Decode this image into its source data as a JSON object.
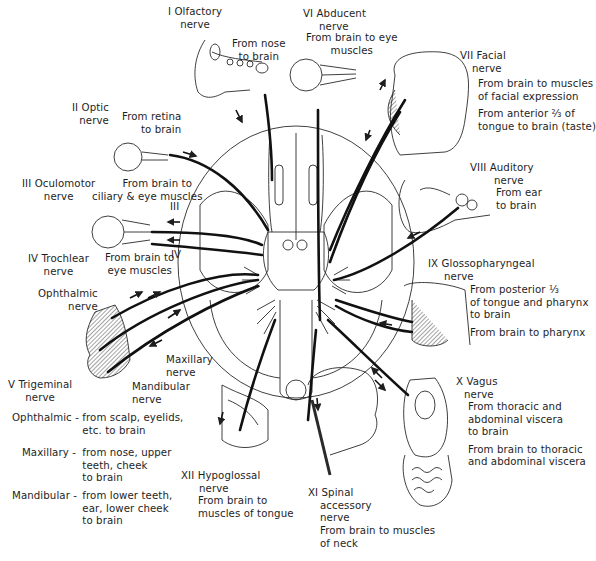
{
  "nerves": {
    "I": {
      "name": "I Olfactory",
      "suffix": "nerve",
      "functions": [
        "From nose to brain"
      ]
    },
    "II": {
      "name": "II Optic",
      "suffix": "nerve",
      "functions": [
        "From retina to brain"
      ]
    },
    "III": {
      "name": "III Oculomotor",
      "suffix": "nerve",
      "functions": [
        "From brain to ciliary & eye muscles"
      ],
      "marker": "III"
    },
    "IV": {
      "name": "IV Trochlear",
      "suffix": "nerve",
      "functions": [
        "From brain to eye muscles"
      ],
      "marker": "IV"
    },
    "V": {
      "name": "V Trigeminal",
      "suffix": "nerve",
      "branches": {
        "ophthalmic_label": "Ophthalmic",
        "ophthalmic_suffix": "nerve",
        "maxillary_label": "Maxillary",
        "maxillary_suffix": "nerve",
        "mandibular_label": "Mandibular",
        "mandibular_suffix": "nerve"
      },
      "details": [
        {
          "branch": "Ophthalmic -",
          "lines": [
            "from scalp, eyelids,",
            "etc. to brain"
          ]
        },
        {
          "branch": "Maxillary -",
          "lines": [
            "from nose, upper",
            "teeth, cheek",
            "to brain"
          ]
        },
        {
          "branch": "Mandibular -",
          "lines": [
            "from lower teeth,",
            "ear, lower cheek",
            "to brain"
          ]
        }
      ]
    },
    "VI": {
      "name": "VI Abducent",
      "suffix": "nerve",
      "functions": [
        "From brain to eye muscles"
      ]
    },
    "VII": {
      "name": "VII Facial",
      "suffix": "nerve",
      "functions": [
        "From brain to muscles of facial expression",
        "From anterior ⅔ of tongue to brain (taste)"
      ]
    },
    "VIII": {
      "name": "VIII Auditory",
      "suffix": "nerve",
      "functions": [
        "From ear to brain"
      ]
    },
    "IX": {
      "name": "IX Glossopharyngeal",
      "suffix": "nerve",
      "functions": [
        "From posterior ⅓ of tongue and pharynx to brain",
        "From brain to pharynx"
      ]
    },
    "X": {
      "name": "X Vagus",
      "suffix": "nerve",
      "functions": [
        "From thoracic and abdominal viscera to brain",
        "From brain to thoracic and abdominal viscera"
      ]
    },
    "XI": {
      "name": "XI Spinal",
      "suffix2": "accessory",
      "suffix": "nerve",
      "functions": [
        "From brain to muscles of neck"
      ]
    },
    "XII": {
      "name": "XII Hypoglossal",
      "suffix": "nerve",
      "functions": [
        "From brain to muscles of tongue"
      ]
    }
  },
  "lines": {
    "I_f1a": "From nose",
    "I_f1b": "to brain",
    "II_f1a": "From retina",
    "II_f1b": "to brain",
    "III_f1a": "From brain to",
    "III_f1b": "ciliary & eye muscles",
    "IV_f1a": "From brain to",
    "IV_f1b": "eye muscles",
    "VI_f1a": "From brain to eye",
    "VI_f1b": "muscles",
    "VII_f1a": "From brain to muscles",
    "VII_f1b": "of facial expression",
    "VII_f2a": "From anterior ⅔ of",
    "VII_f2b": "tongue to brain (taste)",
    "VIII_f1a": "From ear",
    "VIII_f1b": "to brain",
    "IX_f1a": "From posterior ⅓",
    "IX_f1b": "of tongue and pharynx",
    "IX_f1c": "to brain",
    "IX_f2a": "From brain to pharynx",
    "X_f1a": "From thoracic and",
    "X_f1b": "abdominal viscera",
    "X_f1c": "to brain",
    "X_f2a": "From brain to thoracic",
    "X_f2b": "and abdominal viscera",
    "XI_f1a": "From brain to muscles",
    "XI_f1b": "of neck",
    "XII_f1a": "From brain to",
    "XII_f1b": "muscles of tongue"
  },
  "colors": {
    "ink": "#1e1e1e",
    "background": "#ffffff"
  }
}
